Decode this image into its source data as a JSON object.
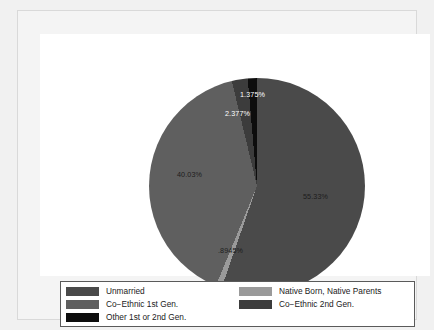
{
  "chart_data": {
    "type": "pie",
    "title": "",
    "subtitle": "",
    "xlabel": "",
    "ylabel": "",
    "legend_position": "bottom",
    "grid": false,
    "start_angle_deg": 0,
    "direction": "clockwise",
    "categories": [
      "Unmarried",
      "Native Born, Native Parents",
      "Co−Ethnic 1st Gen.",
      "Co−Ethnic 2nd Gen.",
      "Other 1st or 2nd Gen."
    ],
    "values": [
      55.33,
      0.8945,
      40.03,
      2.377,
      1.375
    ],
    "value_labels": [
      "55.33%",
      ".8945%",
      "40.03%",
      "2.377%",
      "1.375%"
    ],
    "colors": [
      "#4a4a4a",
      "#9a9a9a",
      "#5f5f5f",
      "#3c3c3c",
      "#0d0d0d"
    ],
    "slices": [
      {
        "name": "Unmarried",
        "value": 55.33,
        "label": "55.33%",
        "color": "#4a4a4a",
        "label_color": "dark",
        "label_x": 154,
        "label_y": 114
      },
      {
        "name": "Native Born, Native Parents",
        "value": 0.8945,
        "label": ".8945%",
        "color": "#9a9a9a",
        "label_color": "dark",
        "label_x": 69,
        "label_y": 168
      },
      {
        "name": "Co−Ethnic 1st Gen.",
        "value": 40.03,
        "label": "40.03%",
        "color": "#5f5f5f",
        "label_color": "dark",
        "label_x": 28,
        "label_y": 92
      },
      {
        "name": "Co−Ethnic 2nd Gen.",
        "value": 2.377,
        "label": "2.377%",
        "color": "#3c3c3c",
        "label_color": "light",
        "label_x": 76,
        "label_y": 31
      },
      {
        "name": "Other 1st or 2nd Gen.",
        "value": 1.375,
        "label": "1.375%",
        "color": "#0d0d0d",
        "label_color": "light",
        "label_x": 91,
        "label_y": 12
      }
    ]
  },
  "legend": {
    "items": [
      {
        "label": "Unmarried",
        "color": "#4a4a4a"
      },
      {
        "label": "Native Born, Native Parents",
        "color": "#9a9a9a"
      },
      {
        "label": "Co−Ethnic 1st Gen.",
        "color": "#5f5f5f"
      },
      {
        "label": "Co−Ethnic 2nd Gen.",
        "color": "#3c3c3c"
      },
      {
        "label": "Other 1st or 2nd Gen.",
        "color": "#0d0d0d"
      }
    ]
  },
  "theme": {
    "page_background": "#f1f1f1",
    "canvas_background": "#ffffff",
    "frame_border": "#d9d9d9",
    "legend_border": "#5a5a5a",
    "text_color": "#1a1a1a"
  }
}
